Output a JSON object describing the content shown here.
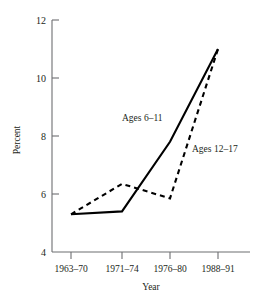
{
  "chart_data": {
    "type": "line",
    "title": "",
    "subtitle": "",
    "xlabel": "Year",
    "ylabel": "Percent",
    "categories": [
      "1963–70",
      "1971–74",
      "1976–80",
      "1988–91"
    ],
    "series": [
      {
        "name": "Ages 6–11",
        "style": "solid",
        "color": "#000000",
        "values": [
          5.3,
          5.4,
          7.8,
          11.0
        ]
      },
      {
        "name": "Ages 12–17",
        "style": "dashed",
        "color": "#000000",
        "values": [
          5.3,
          6.35,
          5.85,
          11.0
        ]
      }
    ],
    "ylim": [
      4,
      12
    ],
    "yticks": [
      4,
      6,
      8,
      10,
      12
    ],
    "ytick_labels": [
      "4",
      "6",
      "8",
      "10",
      "12"
    ],
    "xlim_categories": 4,
    "grid": false,
    "legend": "inline-annotations",
    "annotations": [
      {
        "text": "Ages 6–11",
        "anchor_series": "Ages 6–11"
      },
      {
        "text": "Ages 12–17",
        "anchor_series": "Ages 12–17"
      }
    ],
    "axis_color": "#6d6e71",
    "background": "#ffffff"
  },
  "axes": {
    "y_label": "Percent",
    "x_label": "Year",
    "y_ticks": [
      {
        "value": 12,
        "label": "12"
      },
      {
        "value": 10,
        "label": "10"
      },
      {
        "value": 8,
        "label": "8"
      },
      {
        "value": 6,
        "label": "6"
      },
      {
        "value": 4,
        "label": "4"
      }
    ],
    "x_ticks": [
      {
        "label": "1963–70"
      },
      {
        "label": "1971–74"
      },
      {
        "label": "1976–80"
      },
      {
        "label": "1988–91"
      }
    ]
  },
  "labels": {
    "series_a": "Ages 6–11",
    "series_b": "Ages 12–17"
  }
}
